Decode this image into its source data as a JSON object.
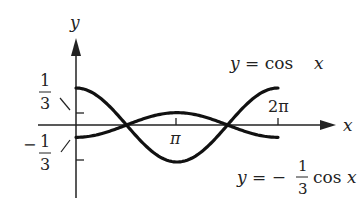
{
  "chart_data": {
    "type": "line",
    "title": "",
    "xlabel": "x",
    "ylabel": "y",
    "x_ticks": [
      "π",
      "2π"
    ],
    "y_ticks": [
      "1/3",
      "-1/3"
    ],
    "xlim": [
      0,
      6.2832
    ],
    "ylim": [
      -1,
      1
    ],
    "grid": false,
    "series": [
      {
        "name": "y = cos x",
        "x": [
          0,
          0.785,
          1.571,
          2.356,
          3.1416,
          3.927,
          4.712,
          5.498,
          6.2832
        ],
        "values": [
          1,
          0.707,
          0,
          -0.707,
          -1,
          -0.707,
          0,
          0.707,
          1
        ]
      },
      {
        "name": "y = -1/3 cos x",
        "x": [
          0,
          0.785,
          1.571,
          2.356,
          3.1416,
          3.927,
          4.712,
          5.498,
          6.2832
        ],
        "values": [
          -0.333,
          -0.236,
          0,
          0.236,
          0.333,
          0.236,
          0,
          -0.236,
          -0.333
        ]
      }
    ]
  },
  "labels": {
    "y_axis": "y",
    "x_axis": "x",
    "tick_pi": "π",
    "tick_2pi": "2π",
    "one": "1",
    "three": "3",
    "minus": "−",
    "curve1_y": "y",
    "curve1_eq": "= cos",
    "curve1_x": "x",
    "curve2_y": "y",
    "curve2_eq": "= −",
    "curve2_cos": "cos",
    "curve2_x": "x"
  }
}
